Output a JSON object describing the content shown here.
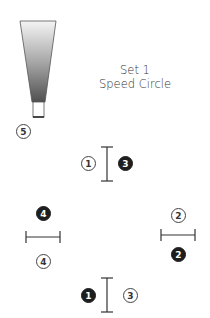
{
  "title": {
    "line1": "Set 1",
    "line2": "Speed Circle"
  },
  "colors": {
    "stroke": "#333333",
    "filled_marker": "#1e1e1e",
    "cone_top": "#f2f2f2",
    "cone_bottom": "#555555"
  },
  "cone": {
    "marker_label": "5"
  },
  "stations": [
    {
      "id": "top",
      "orientation": "vertical",
      "open_label": "1",
      "filled_label": "3"
    },
    {
      "id": "left",
      "orientation": "horizontal",
      "filled_label": "4",
      "open_label": "4"
    },
    {
      "id": "right",
      "orientation": "horizontal",
      "open_label": "2",
      "filled_label": "2"
    },
    {
      "id": "bottom",
      "orientation": "vertical",
      "filled_label": "1",
      "open_label": "3"
    }
  ]
}
